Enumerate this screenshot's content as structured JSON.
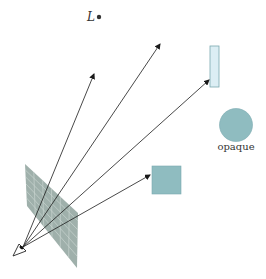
{
  "diagram": {
    "light_label": "L",
    "opaque_label": "opaque",
    "colors": {
      "object_fill": "#8fbcc0",
      "object_stroke": "#6e9ea3",
      "glass_fill": "#dceef4",
      "glass_stroke": "#7aa9b0",
      "grid_fill": "#9fb0ab",
      "grid_line": "#c8d4d0",
      "ray": "#1a1a1a"
    }
  }
}
